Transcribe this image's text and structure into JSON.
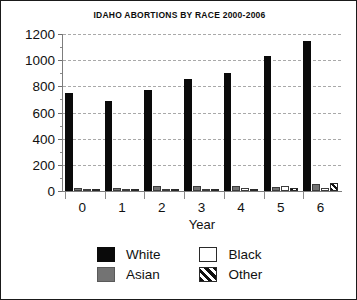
{
  "chart_data": {
    "type": "bar",
    "title": "IDAHO ABORTIONS BY RACE 2000-2006",
    "xlabel": "Year",
    "ylabel": "",
    "categories": [
      "0",
      "1",
      "2",
      "3",
      "4",
      "5",
      "6"
    ],
    "series": [
      {
        "name": "White",
        "color": "#0a0a0a",
        "fill": "solid-black",
        "values": [
          750,
          685,
          775,
          855,
          905,
          1030,
          1150
        ]
      },
      {
        "name": "Asian",
        "color": "#737373",
        "fill": "solid-gray",
        "values": [
          20,
          22,
          35,
          38,
          42,
          32,
          52
        ]
      },
      {
        "name": "Black",
        "color": "#ffffff",
        "fill": "solid-white",
        "values": [
          18,
          12,
          10,
          14,
          20,
          40,
          20
        ]
      },
      {
        "name": "Other",
        "color": "#111111",
        "fill": "diagonal-hatch",
        "values": [
          4,
          10,
          6,
          14,
          8,
          22,
          62
        ]
      }
    ],
    "ylim": [
      0,
      1200
    ],
    "ytick_labels": [
      "1200",
      "1000",
      "800",
      "600",
      "400",
      "200",
      "0"
    ],
    "ytick_values": [
      1200,
      1000,
      800,
      600,
      400,
      200,
      0
    ],
    "yminor_values": [
      1100,
      900,
      700,
      500,
      300,
      100
    ],
    "grid": "horizontal-dashed",
    "legend_position": "bottom",
    "legend_entries": [
      "White",
      "Black",
      "Asian",
      "Other"
    ]
  }
}
